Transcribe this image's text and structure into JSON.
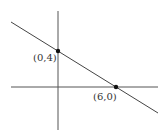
{
  "diagram": {
    "type": "coordinate-line-graph",
    "axes": {
      "x_axis": {
        "x1": 11,
        "y1": 87,
        "x2": 158,
        "y2": 87
      },
      "y_axis": {
        "x1": 58,
        "y1": 11,
        "x2": 58,
        "y2": 130
      }
    },
    "line": {
      "x1": 11,
      "y1": 22,
      "x2": 158,
      "y2": 113
    },
    "points": [
      {
        "label": "(0,4)",
        "cx": 58,
        "cy": 51,
        "label_x": 33,
        "label_y": 61
      },
      {
        "label": "(6,0)",
        "cx": 116,
        "cy": 87,
        "label_x": 93,
        "label_y": 100
      }
    ],
    "colors": {
      "axis": "#555555",
      "line": "#444444",
      "point": "#111111",
      "text": "#333333"
    }
  }
}
